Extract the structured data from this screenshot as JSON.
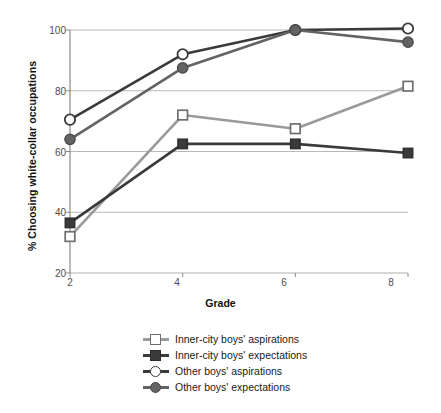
{
  "chart_data": {
    "type": "line",
    "title": "",
    "xlabel": "Grade",
    "ylabel": "% Choosing white-collar occupations",
    "x": [
      2,
      4,
      6,
      8
    ],
    "categories": [
      "2",
      "4",
      "6",
      "8"
    ],
    "xticklabels": [
      "2",
      "4",
      "6",
      "8"
    ],
    "yticklabels": [
      "20",
      "40",
      "60",
      "80",
      "100"
    ],
    "yticks": [
      20,
      40,
      60,
      80,
      100
    ],
    "xlim": [
      2,
      8
    ],
    "ylim": [
      20,
      100
    ],
    "grid": "horizontal",
    "legend_position": "below",
    "series": [
      {
        "name": "Inner-city boys' aspirations",
        "values": [
          32,
          72,
          67.5,
          81.5
        ],
        "color": "#9a9a9a",
        "marker": "open-square"
      },
      {
        "name": "Inner-city boys' expectations",
        "values": [
          36.5,
          62.5,
          62.5,
          59.5
        ],
        "color": "#3a3a3a",
        "marker": "filled-square"
      },
      {
        "name": "Other boys' aspirations",
        "values": [
          70.5,
          92,
          100,
          100.5
        ],
        "color": "#3a3a3a",
        "marker": "open-circle"
      },
      {
        "name": "Other boys' expectations",
        "values": [
          64,
          87.5,
          100,
          96
        ],
        "color": "#636363",
        "marker": "filled-circle"
      }
    ]
  },
  "axes": {
    "y_label": "% Choosing white-collar occupations",
    "x_label": "Grade",
    "y_ticks": [
      "100",
      "80",
      "60",
      "40",
      "20"
    ],
    "x_ticks": [
      "2",
      "4",
      "6",
      "8"
    ]
  },
  "legend": {
    "items": [
      {
        "label": "Inner-city boys' aspirations"
      },
      {
        "label": "Inner-city boys' expectations"
      },
      {
        "label": "Other boys' aspirations"
      },
      {
        "label": "Other boys' expectations"
      }
    ]
  },
  "colors": {
    "light_gray": "#9a9a9a",
    "mid_gray": "#636363",
    "dark": "#3a3a3a",
    "grid": "#b0b0b0",
    "axis": "#808080",
    "text": "#1a1a1a"
  }
}
